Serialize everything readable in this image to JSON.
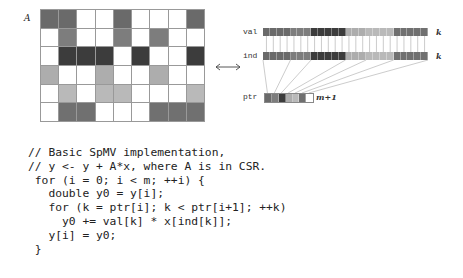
{
  "figure": {
    "matrix_label": "A",
    "matrix": {
      "rows": 6,
      "cols": 9,
      "row_colors": [
        "#6a6a6a",
        "#7d7d7d",
        "#3c3c3c",
        "#adadad",
        "#b9b9b9",
        "#707070"
      ],
      "pattern": [
        [
          1,
          1,
          0,
          0,
          1,
          0,
          0,
          0,
          1
        ],
        [
          0,
          1,
          0,
          0,
          1,
          0,
          1,
          0,
          0
        ],
        [
          0,
          1,
          1,
          1,
          0,
          1,
          0,
          0,
          1
        ],
        [
          1,
          0,
          0,
          1,
          0,
          0,
          1,
          0,
          0
        ],
        [
          0,
          1,
          0,
          1,
          1,
          0,
          0,
          0,
          1
        ],
        [
          0,
          1,
          1,
          0,
          0,
          0,
          1,
          1,
          1
        ]
      ]
    },
    "arrow": "double-headed-arrow",
    "arrays": {
      "val_label": "val",
      "ind_label": "ind",
      "ptr_label": "ptr",
      "val_length_label": "k",
      "ind_length_label": "k",
      "ptr_length_label": "m+1"
    }
  },
  "code": {
    "lines": [
      "// Basic SpMV implementation,",
      "// y <- y + A*x, where A is in CSR.",
      " for (i = 0; i < m; ++i) {",
      "   double y0 = y[i];",
      "   for (k = ptr[i]; k < ptr[i+1]; ++k)",
      "     y0 += val[k] * x[ind[k]];",
      "   y[i] = y0;",
      " }"
    ]
  }
}
